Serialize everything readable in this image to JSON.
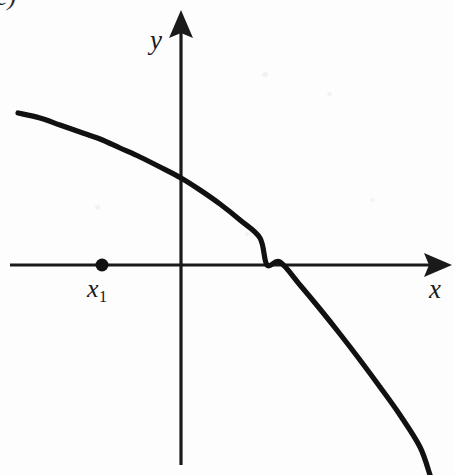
{
  "figure": {
    "panel_label": "c)",
    "background_color": "#fdfdfd",
    "ink_color": "#111111",
    "width": 454,
    "height": 475
  },
  "axes": {
    "x_label": "x",
    "y_label": "y",
    "x_label_icon": "x-axis-arrow-icon",
    "y_label_icon": "y-axis-arrow-icon",
    "origin": {
      "x": 181,
      "y": 265
    },
    "x_axis_start": {
      "x": 10,
      "y": 265
    },
    "x_axis_end": {
      "x": 452,
      "y": 265
    },
    "y_axis_top": {
      "x": 181,
      "y": 10
    },
    "y_axis_bottom": {
      "x": 181,
      "y": 465
    }
  },
  "marked_point": {
    "label_base": "x",
    "label_sub": "1",
    "label_full": "x1",
    "x": 102,
    "y": 265,
    "radius": 6.5,
    "on_axis": "x"
  },
  "chart_data": {
    "type": "line",
    "title": "",
    "subtitle": "",
    "xlabel": "x",
    "ylabel": "y",
    "grid": false,
    "legend": null,
    "annotations": [
      {
        "text": "x1",
        "x": 102,
        "y": 265,
        "kind": "point-marker"
      }
    ],
    "axis_style": "arrow-ended cartesian axes, no tick marks",
    "xlim": [
      10,
      452
    ],
    "ylim": [
      465,
      10
    ],
    "series": [
      {
        "name": "f(x)",
        "description": "smooth concave-down decreasing curve crossing the x-axis to the right of the origin",
        "points_px": [
          [
            18,
            113
          ],
          [
            40,
            118
          ],
          [
            60,
            125
          ],
          [
            80,
            132
          ],
          [
            100,
            139
          ],
          [
            120,
            148
          ],
          [
            140,
            157
          ],
          [
            160,
            167
          ],
          [
            181,
            178
          ],
          [
            200,
            190
          ],
          [
            220,
            204
          ],
          [
            240,
            220
          ],
          [
            260,
            238
          ],
          [
            267,
            265
          ],
          [
            280,
            262
          ],
          [
            300,
            285
          ],
          [
            320,
            309
          ],
          [
            340,
            334
          ],
          [
            360,
            360
          ],
          [
            380,
            387
          ],
          [
            400,
            415
          ],
          [
            420,
            447
          ],
          [
            430,
            475
          ]
        ],
        "x_intercept_px": 267,
        "y_intercept_px": 178
      }
    ]
  }
}
